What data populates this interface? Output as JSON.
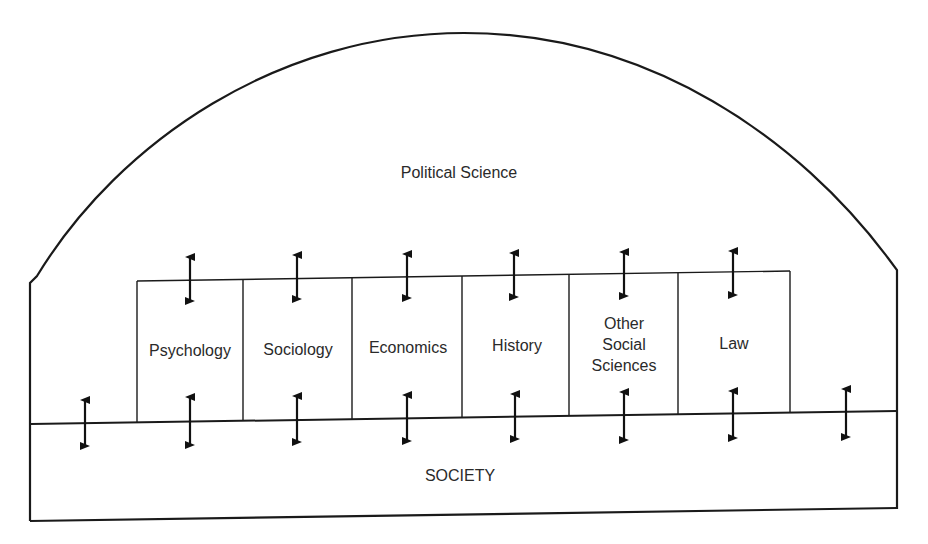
{
  "diagram": {
    "title_region": "Political Science",
    "base_region": "SOCIETY",
    "disciplines": [
      {
        "label": "Psychology"
      },
      {
        "label": "Sociology"
      },
      {
        "label": "Economics"
      },
      {
        "label": "History"
      },
      {
        "label": "Other Social Sciences",
        "lines": [
          "Other",
          "Social",
          "Sciences"
        ]
      },
      {
        "label": "Law"
      }
    ],
    "arrows": {
      "type": "double-headed-vertical",
      "top_row_count": 6,
      "bottom_row_count": 8
    },
    "colors": {
      "line": "#1a1a1a",
      "text": "#2a2a2a",
      "background": "#ffffff"
    }
  }
}
